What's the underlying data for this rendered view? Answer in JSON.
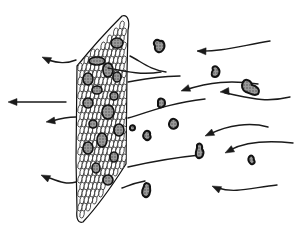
{
  "figure": {
    "colors": {
      "ink": "#1a1a1a",
      "paper": "#ffffff",
      "particle_fill": "#8a8a8a"
    },
    "incoming_flows": [
      {
        "id": "in-1"
      },
      {
        "id": "in-2"
      },
      {
        "id": "in-3"
      },
      {
        "id": "in-4"
      },
      {
        "id": "in-5"
      },
      {
        "id": "in-6"
      },
      {
        "id": "in-7"
      },
      {
        "id": "in-8"
      }
    ],
    "outgoing_flows": [
      {
        "id": "out-1"
      },
      {
        "id": "out-2"
      },
      {
        "id": "out-3"
      },
      {
        "id": "out-4"
      },
      {
        "id": "out-5"
      }
    ],
    "free_particle_count": 10,
    "trapped_particle_count": 16
  }
}
